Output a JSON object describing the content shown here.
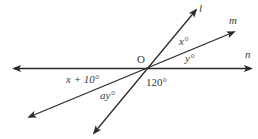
{
  "diagram": {
    "type": "intersecting-lines",
    "center_label": "O",
    "lines": [
      {
        "name": "l",
        "label": "l"
      },
      {
        "name": "m",
        "label": "m"
      },
      {
        "name": "n",
        "label": "n"
      }
    ],
    "angles": {
      "between_l_m": "x°",
      "between_m_n": "y°",
      "left_upper": "x + 10°",
      "lower_right": "120°",
      "lower_between_m_l": "ay°"
    },
    "colors": {
      "stroke": "#2a2a2a",
      "text": "#3a3a3a"
    }
  }
}
